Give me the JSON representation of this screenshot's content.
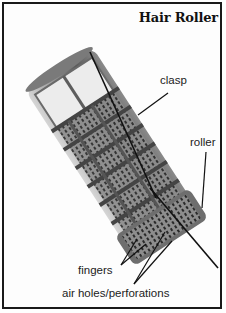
{
  "diagram": {
    "title": "Hair Roller",
    "labels": {
      "clasp": "clasp",
      "roller": "roller",
      "fingers": "fingers",
      "air_holes": "air holes/perforations"
    }
  },
  "colors": {
    "border": "#1a1a1a",
    "background": "#fdfdfd",
    "roller_body": "#bdbdbd",
    "roller_dark": "#3a3a3a",
    "roller_light": "#e9e9e9",
    "line": "#111111"
  }
}
